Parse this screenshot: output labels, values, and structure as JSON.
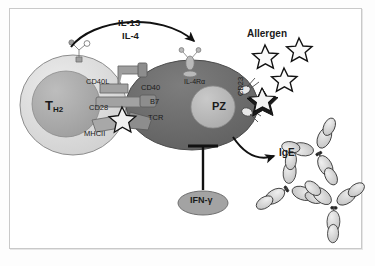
{
  "figure": {
    "frame_color": "#c9c9c9",
    "background": "#ffffff"
  },
  "colors": {
    "t_cell_body": "#d8d8d8",
    "t_cell_nucleus": "#a9a9a9",
    "b_cell_body": "#6e6e6e",
    "b_cell_nucleus": "#b8b8b8",
    "receptor": "#9a9a9a",
    "ifng_pill": "#a0a0a0",
    "line": "#111111",
    "antibody_fill": "#d4d4d4"
  },
  "cytokine_arrow": {
    "labels": [
      "IL-13",
      "IL-4"
    ],
    "from": "t-cell",
    "to": "b-cell-il4-receptor"
  },
  "t_cell": {
    "name": "T_H2",
    "label_main": "T",
    "label_sub": "H2",
    "receptors": [
      {
        "name": "CD40L",
        "label": "CD40L"
      },
      {
        "name": "CD28",
        "label": "CD28"
      },
      {
        "name": "MHCII",
        "label": "MHCII"
      }
    ]
  },
  "b_cell": {
    "name": "PZ",
    "nucleus_label": "PZ",
    "receptors": [
      {
        "name": "CD40",
        "label": "CD40"
      },
      {
        "name": "B7",
        "label": "B7"
      },
      {
        "name": "TCR",
        "label": "TCR"
      },
      {
        "name": "IL-4Ra",
        "label": "IL-4Rα"
      },
      {
        "name": "CD23",
        "label": "CD23"
      }
    ]
  },
  "allergen": {
    "label": "Allergen",
    "free_count": 3,
    "bound_count": 1
  },
  "ige": {
    "label": "IgE",
    "antibody_count": 3
  },
  "inhibitor": {
    "label": "IFN-γ",
    "type": "inhibition",
    "target": "b-cell"
  }
}
